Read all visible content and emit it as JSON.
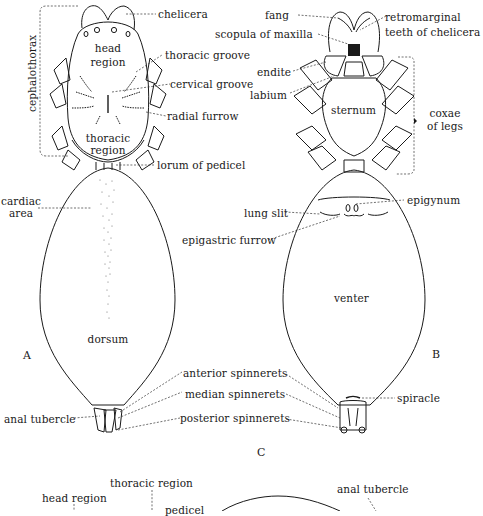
{
  "figure": {
    "panel_labels": {
      "a": "A",
      "b": "B",
      "c": "C"
    },
    "dorsal_view": {
      "region_labels": {
        "head": "head\nregion",
        "head_line1": "head",
        "head_line2": "region",
        "thoracic_line1": "thoracic",
        "thoracic_line2": "region",
        "dorsum": "dorsum"
      },
      "callouts": {
        "cephalothorax": "cephalothorax",
        "chelicera": "chelicera",
        "thoracic_groove": "thoracic groove",
        "cervical_groove": "cervical groove",
        "radial_furrow": "radial furrow",
        "lorum_of_pedicel": "lorum of  pedicel",
        "cardiac_area_line1": "cardiac",
        "cardiac_area_line2": "area",
        "anal_tubercle": "anal tubercle"
      }
    },
    "ventral_view": {
      "region_labels": {
        "sternum": "sternum",
        "venter": "venter"
      },
      "callouts": {
        "fang": "fang",
        "scopula_of_maxilla": "scopula of maxilla",
        "retromarginal_line1": "retromarginal",
        "retromarginal_line2": "teeth of chelicera",
        "endite": "endite",
        "labium": "labium",
        "coxae_line1": "coxae",
        "coxae_line2": "of legs",
        "epigynum": "epigynum",
        "lung_slit": "lung slit",
        "epigastric_furrow": "epigastric furrow",
        "spiracle": "spiracle"
      }
    },
    "shared_callouts": {
      "anterior_spinnerets": "anterior spinnerets",
      "median_spinnerets": "median spinnerets",
      "posterior_spinnerets": "posterior spinnerets"
    },
    "lateral_view": {
      "callouts": {
        "thoracic_region": "thoracic region",
        "head_region": "head region",
        "pedicel": "pedicel",
        "anal_tubercle": "anal tubercle"
      }
    }
  }
}
